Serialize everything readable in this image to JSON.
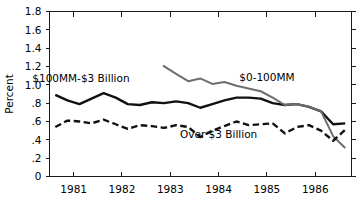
{
  "chart_data": {
    "type": "line",
    "title": "",
    "xlabel": "",
    "ylabel": "Percent",
    "ylim": [
      0,
      1.8
    ],
    "xlim": [
      1980.5,
      1986.75
    ],
    "grid": false,
    "legend_position": "inline-annotations",
    "y_ticks": [
      "0",
      ".2",
      ".4",
      ".6",
      ".8",
      "1.0",
      "1.2",
      "1.4",
      "1.6",
      "1.8"
    ],
    "y_tick_values": [
      0,
      0.2,
      0.4,
      0.6,
      0.8,
      1.0,
      1.2,
      1.4,
      1.6,
      1.8
    ],
    "x_ticks": [
      "1981",
      "1982",
      "1983",
      "1984",
      "1985",
      "1986"
    ],
    "x_tick_values": [
      1981,
      1982,
      1983,
      1984,
      1985,
      1986
    ],
    "series": [
      {
        "name": "$100MM-$3 Billion",
        "style": "solid",
        "color": "#111111",
        "width": 2.4,
        "label_x": 1981.15,
        "label_y": 1.03,
        "x": [
          1980.62,
          1980.87,
          1981.12,
          1981.37,
          1981.62,
          1981.87,
          1982.12,
          1982.37,
          1982.62,
          1982.87,
          1983.12,
          1983.37,
          1983.62,
          1983.87,
          1984.12,
          1984.37,
          1984.62,
          1984.87,
          1985.12,
          1985.37,
          1985.62,
          1985.87,
          1986.12,
          1986.37,
          1986.62
        ],
        "y": [
          0.89,
          0.83,
          0.79,
          0.85,
          0.91,
          0.86,
          0.79,
          0.78,
          0.81,
          0.8,
          0.82,
          0.8,
          0.75,
          0.79,
          0.83,
          0.86,
          0.86,
          0.85,
          0.8,
          0.78,
          0.79,
          0.76,
          0.71,
          0.57,
          0.58
        ]
      },
      {
        "name": "$0-100MM",
        "style": "solid",
        "color": "#6e6e6e",
        "width": 2.0,
        "label_x": 1985.0,
        "label_y": 1.04,
        "x": [
          1982.85,
          1983.12,
          1983.37,
          1983.62,
          1983.87,
          1984.12,
          1984.37,
          1984.62,
          1984.87,
          1985.12,
          1985.37,
          1985.62,
          1985.87,
          1986.12,
          1986.37,
          1986.62
        ],
        "y": [
          1.21,
          1.12,
          1.04,
          1.07,
          1.01,
          1.03,
          0.99,
          0.96,
          0.93,
          0.86,
          0.78,
          0.79,
          0.76,
          0.71,
          0.44,
          0.31
        ]
      },
      {
        "name": "Over $3 Billion",
        "style": "dashed",
        "color": "#111111",
        "width": 2.4,
        "label_x": 1984.0,
        "label_y": 0.42,
        "x": [
          1980.62,
          1980.87,
          1981.12,
          1981.37,
          1981.62,
          1981.87,
          1982.12,
          1982.37,
          1982.62,
          1982.87,
          1983.12,
          1983.37,
          1983.62,
          1983.87,
          1984.12,
          1984.37,
          1984.62,
          1984.87,
          1985.12,
          1985.37,
          1985.62,
          1985.87,
          1986.12,
          1986.37,
          1986.62
        ],
        "y": [
          0.54,
          0.61,
          0.6,
          0.58,
          0.62,
          0.57,
          0.52,
          0.56,
          0.55,
          0.53,
          0.56,
          0.54,
          0.43,
          0.5,
          0.55,
          0.6,
          0.56,
          0.57,
          0.58,
          0.47,
          0.54,
          0.56,
          0.5,
          0.39,
          0.51
        ]
      }
    ],
    "annotations": [
      {
        "text": "$100MM-$3 Billion",
        "x": 1981.15,
        "y": 1.03
      },
      {
        "text": "$0-100MM",
        "x": 1985.0,
        "y": 1.04
      },
      {
        "text": "Over $3 Billion",
        "x": 1984.0,
        "y": 0.42
      }
    ]
  },
  "caption": {
    "text": ""
  }
}
